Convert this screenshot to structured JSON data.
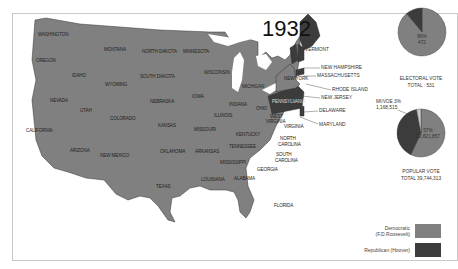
{
  "title": "1932",
  "colors": {
    "democratic": "#808080",
    "republican": "#3c3c3c",
    "other": "#c8c8c8",
    "border": "#333333"
  },
  "states": {
    "washington": "WASHINGTON",
    "oregon": "OREGON",
    "california": "CALIFORNIA",
    "nevada": "NEVADA",
    "idaho": "IDAHO",
    "montana": "MONTANA",
    "wyoming": "WYOMING",
    "utah": "UTAH",
    "arizona": "ARIZONA",
    "colorado": "COLORADO",
    "new_mexico": "NEW MEXICO",
    "north_dakota": "NORTH DAKOTA",
    "south_dakota": "SOUTH DAKOTA",
    "nebraska": "NEBRASKA",
    "kansas": "KANSAS",
    "oklahoma": "OKLAHOMA",
    "texas": "TEXAS",
    "minnesota": "MINNESOTA",
    "iowa": "IOWA",
    "missouri": "MISSOURI",
    "arkansas": "ARKANSAS",
    "louisiana": "LOUISIANA",
    "wisconsin": "WISCONSIN",
    "illinois": "ILLINOIS",
    "michigan": "MICHIGAN",
    "indiana": "INDIANA",
    "ohio": "OHIO",
    "kentucky": "KENTUCKY",
    "tennessee": "TENNESSEE",
    "mississippi": "MISSISSIPPI",
    "alabama": "ALABAMA",
    "georgia": "GEORGIA",
    "florida": "FLORIDA",
    "south_carolina_1": "SOUTH",
    "south_carolina_2": "CAROLINA",
    "north_carolina_1": "NORTH",
    "north_carolina_2": "CAROLINA",
    "virginia": "VIRGINIA",
    "west_virginia_1": "WEST",
    "west_virginia_2": "VIRGINIA",
    "pennsylvania": "PENNSYLVANIA",
    "new_york": "NEW YORK",
    "vermont": "VERMONT",
    "new_hampshire": "NEW HAMPSHIRE",
    "massachusetts": "MASSACHUSETTS",
    "rhode_island": "RHODE ISLAND",
    "new_jersey": "NEW JERSEY",
    "delaware": "DELAWARE",
    "maryland": "MARYLAND"
  },
  "electoral_vote": {
    "label": "ELECTORAL VOTE",
    "total_label": "TOTAL : 531",
    "dem_pct": "89%",
    "dem_count": "472",
    "dem_fraction": 0.889,
    "rep_fraction": 0.111
  },
  "popular_vote": {
    "label": "POPULAR VOTE",
    "total_label": "TOTAL 39,744,313",
    "dem_pct": "57%",
    "dem_count": "22,821,857",
    "other_label": "MI/VOE 3%",
    "other_count": "1,168,515",
    "dem_fraction": 0.57,
    "rep_fraction": 0.4,
    "other_fraction": 0.03
  },
  "legend": {
    "democratic_1": "Democratic",
    "democratic_2": "(F.D.Roosevelt)",
    "republican": "Republican (Hoover)"
  }
}
